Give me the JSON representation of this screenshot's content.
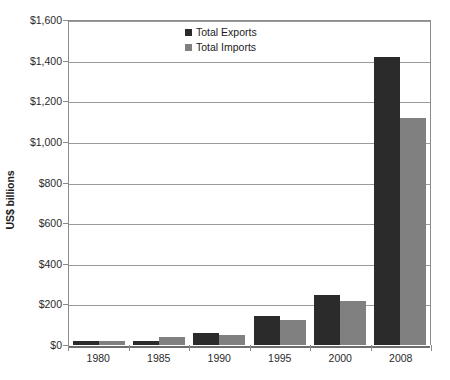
{
  "chart_data": {
    "type": "bar",
    "title": "",
    "subtitle": "",
    "xlabel": "",
    "ylabel": "US$ billions",
    "categories": [
      "1980",
      "1985",
      "1990",
      "1995",
      "2000",
      "2008"
    ],
    "series": [
      {
        "name": "Total Exports",
        "color": "#2b2b2b",
        "values": [
          18,
          22,
          57,
          145,
          245,
          1420
        ]
      },
      {
        "name": "Total Imports",
        "color": "#808080",
        "values": [
          21,
          38,
          48,
          125,
          215,
          1120
        ]
      }
    ],
    "ylim": [
      0,
      1600
    ],
    "ytick_values": [
      0,
      200,
      400,
      600,
      800,
      1000,
      1200,
      1400,
      1600
    ],
    "ytick_labels": [
      "$0",
      "$200",
      "$400",
      "$600",
      "$800",
      "$1,000",
      "$1,200",
      "$1,400",
      "$1,600"
    ],
    "grid": true,
    "grid_axis": "y",
    "legend_position": "top-center",
    "legend": [
      "Total Exports",
      "Total Imports"
    ]
  }
}
